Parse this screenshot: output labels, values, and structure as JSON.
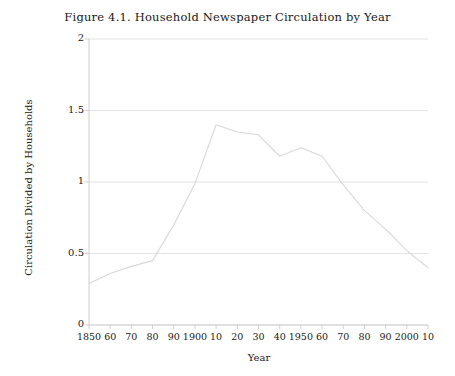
{
  "figure": {
    "title": "Figure 4.1.  Household Newspaper Circulation by Year"
  },
  "chart_data": {
    "type": "line",
    "title": "Figure 4.1.  Household Newspaper Circulation by Year",
    "xlabel": "Year",
    "ylabel": "Circulation Divided by Households",
    "xlim": [
      1850,
      2010
    ],
    "ylim": [
      0,
      2
    ],
    "grid": true,
    "legend": null,
    "line_color": "#d8d8d8",
    "x_tick_labels": [
      "1850",
      "60",
      "70",
      "80",
      "90",
      "1900",
      "10",
      "20",
      "30",
      "40",
      "1950",
      "60",
      "70",
      "80",
      "90",
      "2000",
      "10"
    ],
    "x_tick_values": [
      1850,
      1860,
      1870,
      1880,
      1890,
      1900,
      1910,
      1920,
      1930,
      1940,
      1950,
      1960,
      1970,
      1980,
      1990,
      2000,
      2010
    ],
    "y_tick_labels": [
      "0",
      "0.5",
      "1",
      "1.5",
      "2"
    ],
    "y_tick_values": [
      0,
      0.5,
      1,
      1.5,
      2
    ],
    "x": [
      1850,
      1860,
      1870,
      1880,
      1890,
      1900,
      1910,
      1920,
      1930,
      1940,
      1950,
      1960,
      1970,
      1980,
      1990,
      2000,
      2010
    ],
    "values": [
      0.29,
      0.36,
      0.41,
      0.45,
      0.7,
      0.99,
      1.4,
      1.35,
      1.33,
      1.18,
      1.24,
      1.18,
      0.98,
      0.8,
      0.67,
      0.52,
      0.4
    ],
    "series": [
      {
        "name": "Circulation Divided by Households",
        "values": [
          0.29,
          0.36,
          0.41,
          0.45,
          0.7,
          0.99,
          1.4,
          1.35,
          1.33,
          1.18,
          1.24,
          1.18,
          0.98,
          0.8,
          0.67,
          0.52,
          0.4
        ]
      }
    ]
  },
  "colors": {
    "line": "#d8d8d8",
    "grid": "#e2e2e2",
    "axis": "#cfcfcf",
    "text": "#1a1a1a"
  }
}
